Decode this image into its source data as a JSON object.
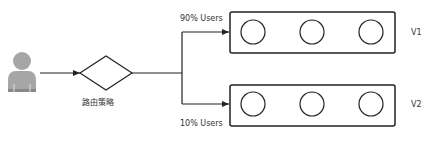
{
  "diagram": {
    "user_node": {
      "icon": "user-avatar-icon",
      "color": "#a6a6a6"
    },
    "router": {
      "label": "路由策略",
      "shape": "diamond"
    },
    "branches": [
      {
        "label": "90% Users",
        "target": "V1"
      },
      {
        "label": "10% Users",
        "target": "V2"
      }
    ],
    "groups": [
      {
        "name": "V1",
        "instances": 3
      },
      {
        "name": "V2",
        "instances": 3
      }
    ],
    "colors": {
      "stroke": "#222222",
      "avatar": "#a6a6a6",
      "text": "#333333"
    }
  }
}
